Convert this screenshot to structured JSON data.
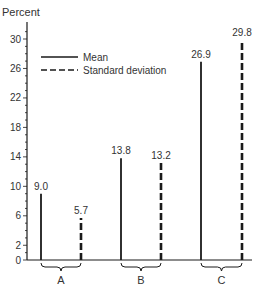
{
  "chart_data": {
    "type": "bar",
    "title": "",
    "ylabel": "Percent",
    "xlabel": "",
    "ylim": [
      0,
      30
    ],
    "yticks_labeled": [
      0,
      2,
      6,
      10,
      14,
      18,
      22,
      26,
      30
    ],
    "grid": false,
    "legend_position": "upper-left",
    "categories": [
      "A",
      "B",
      "C"
    ],
    "series": [
      {
        "name": "Mean",
        "style": "solid",
        "values": [
          9.0,
          13.8,
          26.9
        ]
      },
      {
        "name": "Standard deviation",
        "style": "dashed",
        "values": [
          5.7,
          13.2,
          29.8
        ]
      }
    ],
    "value_labels": {
      "Mean": [
        "9.0",
        "13.8",
        "26.9"
      ],
      "Standard deviation": [
        "5.7",
        "13.2",
        "29.8"
      ]
    }
  },
  "colors": {
    "line": "#1a1a1a",
    "text": "#333333"
  }
}
